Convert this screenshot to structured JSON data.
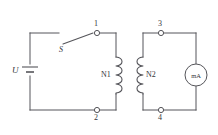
{
  "diagram": {
    "stroke_color": "#55555a",
    "text_color": "#35353a",
    "background": "#ffffff",
    "source": {
      "label": "U",
      "symbol": "battery-cell"
    },
    "switch": {
      "label": "S",
      "state": "open",
      "symbol": "knife-switch"
    },
    "coils": [
      {
        "id": "n1",
        "label": "N1",
        "side": "primary",
        "turns": 4
      },
      {
        "id": "n2",
        "label": "N2",
        "side": "secondary",
        "turns": 4
      }
    ],
    "meter": {
      "label": "mA",
      "symbol": "milliammeter"
    },
    "terminals": [
      {
        "id": "t1",
        "label": "1",
        "position": "top-left-loop-right"
      },
      {
        "id": "t2",
        "label": "2",
        "position": "bottom-left-loop-right"
      },
      {
        "id": "t3",
        "label": "3",
        "position": "top-right-loop-left"
      },
      {
        "id": "t4",
        "label": "4",
        "position": "bottom-right-loop-left"
      }
    ]
  }
}
